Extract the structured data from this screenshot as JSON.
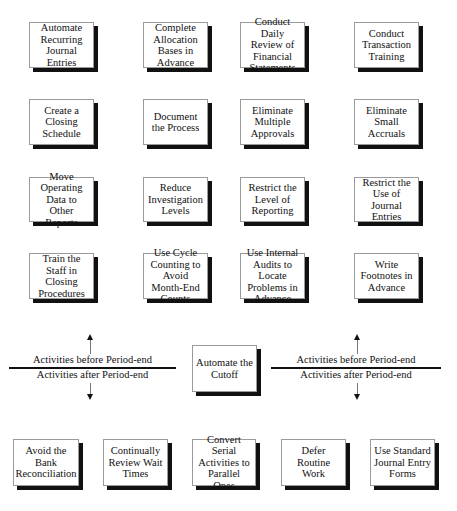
{
  "before_period_end": [
    {
      "label": "Automate Recurring Journal Entries"
    },
    {
      "label": "Complete Allocation Bases in Advance"
    },
    {
      "label": "Conduct Daily Review of Financial Statements"
    },
    {
      "label": "Conduct Transaction Training"
    },
    {
      "label": "Create a Closing Schedule"
    },
    {
      "label": "Document the Process"
    },
    {
      "label": "Eliminate Multiple Approvals"
    },
    {
      "label": "Eliminate Small Accruals"
    },
    {
      "label": "Move Operating Data to Other Reports"
    },
    {
      "label": "Reduce Investigation Levels"
    },
    {
      "label": "Restrict the Level of Reporting"
    },
    {
      "label": "Restrict the Use of Journal Entries"
    },
    {
      "label": "Train the Staff in Closing Procedures"
    },
    {
      "label": "Use Cycle Counting to Avoid Month-End Counts"
    },
    {
      "label": "Use Internal Audits to Locate Problems in Advance"
    },
    {
      "label": "Write Footnotes in Advance"
    }
  ],
  "center": {
    "label": "Automate the Cutoff"
  },
  "divider_left": {
    "before": "Activities before Period-end",
    "after": "Activities after Period-end"
  },
  "divider_right": {
    "before": "Activities before Period-end",
    "after": "Activities after Period-end"
  },
  "after_period_end": [
    {
      "label": "Avoid the Bank Reconciliation"
    },
    {
      "label": "Continually Review Wait Times"
    },
    {
      "label": "Convert Serial Activities to Parallel Ones"
    },
    {
      "label": "Defer Routine Work"
    },
    {
      "label": "Use Standard Journal Entry Forms"
    }
  ]
}
